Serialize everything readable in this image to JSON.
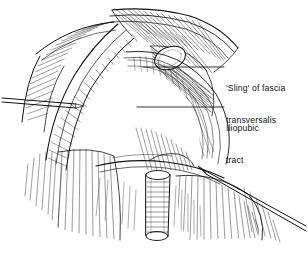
{
  "figure": {
    "type": "anatomical-line-drawing",
    "background_color": "#ffffff",
    "ink_color": "#111111",
    "width": 308,
    "height": 263
  },
  "labels": [
    {
      "id": "sling",
      "name": "sling-of-fascia-transversalis",
      "line1": "'Sling' of fascia",
      "line2": "transversalis",
      "leader_from_x": 143,
      "leader_to_x": 224,
      "leader_y": 67
    },
    {
      "id": "iliopubic",
      "name": "iliopubic-tract",
      "line1": "Iliopubic",
      "line2": "tract",
      "leader_from_x": 137,
      "leader_to_x": 224,
      "leader_y": 107
    }
  ],
  "caption": {
    "text": "",
    "note": "caption clipped at bottom edge of image"
  },
  "structures": [
    {
      "name": "deep-inguinal-ring",
      "description": "white oval opening upper centre-right"
    },
    {
      "name": "spermatic-cord",
      "description": "vertical tubular structure lower centre"
    },
    {
      "name": "retractor-instrument-left",
      "description": "thin straight instrument entering from left edge"
    },
    {
      "name": "probe-instrument-right",
      "description": "thin straight probe entering from lower right"
    },
    {
      "name": "aponeurotic-flap",
      "description": "reflected sheet of aponeurosis across upper left"
    }
  ]
}
